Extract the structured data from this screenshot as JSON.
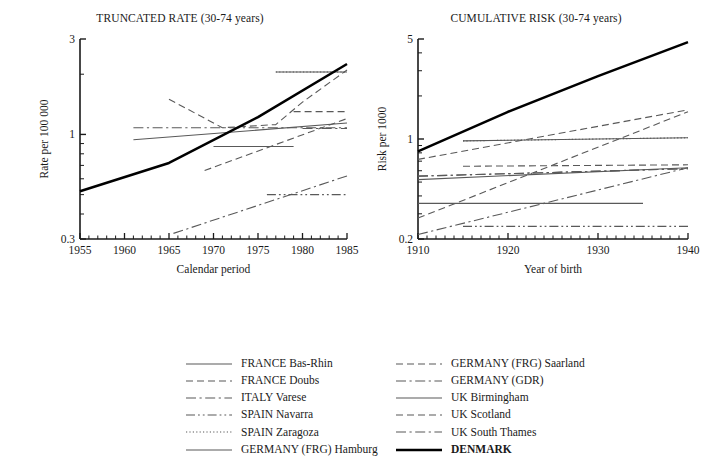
{
  "chart_data": [
    {
      "type": "line",
      "title": "TRUNCATED RATE (30-74 years)",
      "xlabel": "Calendar period",
      "ylabel": "Rate per 100 000",
      "xlim": [
        1955,
        1985
      ],
      "ylim": [
        0.3,
        3
      ],
      "yscale": "log",
      "grid": false,
      "legend_position": "below-figure",
      "xticks": [
        1955,
        1960,
        1965,
        1970,
        1975,
        1980,
        1985
      ],
      "xtick_labels": [
        "1955",
        "1960",
        "1965",
        "1970",
        "1975",
        "1980",
        "1985"
      ],
      "xtick_minor_step": 1,
      "yticks": [
        0.3,
        1,
        3
      ],
      "ytick_labels": [
        "0.3",
        "1",
        "3"
      ],
      "ytick_minor": [
        0.4,
        0.5,
        0.6,
        0.7,
        0.8,
        0.9,
        2
      ],
      "series": [
        {
          "name": "FRANCE Bas-Rhin",
          "style": "solid",
          "x": [
            1961,
            1985
          ],
          "y": [
            0.94,
            1.14
          ]
        },
        {
          "name": "FRANCE Doubs",
          "style": "dashed",
          "x": [
            1965,
            1971,
            1977,
            1980,
            1985
          ],
          "y": [
            1.5,
            1.08,
            1.12,
            1.45,
            2.1
          ]
        },
        {
          "name": "ITALY Varese",
          "style": "dashdot",
          "x": [
            1961,
            1985
          ],
          "y": [
            1.08,
            1.08
          ]
        },
        {
          "name": "SPAIN Navarra",
          "style": "dashdotdot",
          "x": [
            1976,
            1985
          ],
          "y": [
            0.5,
            0.5
          ]
        },
        {
          "name": "SPAIN Zaragoza",
          "style": "dotted",
          "x": [
            1977,
            1985
          ],
          "y": [
            2.05,
            2.05
          ]
        },
        {
          "name": "GERMANY (FRG) Hamburg",
          "style": "solid",
          "x": [
            1977,
            1985
          ],
          "y": [
            2.05,
            2.05
          ]
        },
        {
          "name": "GERMANY (FRG) Saarland",
          "style": "dashed",
          "x": [
            1979,
            1985
          ],
          "y": [
            1.3,
            1.3
          ]
        },
        {
          "name": "GERMANY (GDR)",
          "style": "dashdot",
          "x": [
            1965.5,
            1985
          ],
          "y": [
            0.32,
            0.62
          ]
        },
        {
          "name": "UK Birmingham",
          "style": "solid",
          "x": [
            1970,
            1979
          ],
          "y": [
            0.87,
            0.87
          ]
        },
        {
          "name": "UK Scotland",
          "style": "dashed",
          "x": [
            1969,
            1985
          ],
          "y": [
            0.66,
            1.2
          ]
        },
        {
          "name": "UK South Thames",
          "style": "dashdot",
          "x": [
            1980,
            1985
          ],
          "y": [
            1.07,
            1.07
          ]
        },
        {
          "name": "DENMARK",
          "style": "thick-solid",
          "x": [
            1955,
            1965,
            1975,
            1985
          ],
          "y": [
            0.52,
            0.72,
            1.22,
            2.25
          ]
        }
      ]
    },
    {
      "type": "line",
      "title": "CUMULATIVE RISK (30-74 years)",
      "xlabel": "Year of birth",
      "ylabel": "Risk per 1000",
      "xlim": [
        1910,
        1940
      ],
      "ylim": [
        0.2,
        5
      ],
      "yscale": "log",
      "grid": false,
      "legend_position": "below-figure",
      "xticks": [
        1910,
        1920,
        1930,
        1940
      ],
      "xtick_labels": [
        "1910",
        "1920",
        "1930",
        "1940"
      ],
      "xtick_minor_step": 1,
      "yticks": [
        0.2,
        1,
        5
      ],
      "ytick_labels": [
        "0.2",
        "1",
        "5"
      ],
      "ytick_minor": [
        0.3,
        0.4,
        0.5,
        0.6,
        0.7,
        0.8,
        0.9,
        2,
        3,
        4
      ],
      "series": [
        {
          "name": "FRANCE Bas-Rhin",
          "style": "solid",
          "x": [
            1910,
            1940
          ],
          "y": [
            0.52,
            0.63
          ]
        },
        {
          "name": "FRANCE Doubs",
          "style": "dashed",
          "x": [
            1910,
            1940
          ],
          "y": [
            0.28,
            1.55
          ]
        },
        {
          "name": "ITALY Varese",
          "style": "dashdot",
          "x": [
            1910,
            1940
          ],
          "y": [
            0.55,
            0.62
          ]
        },
        {
          "name": "SPAIN Navarra",
          "style": "dashdotdot",
          "x": [
            1915,
            1940
          ],
          "y": [
            0.245,
            0.245
          ]
        },
        {
          "name": "SPAIN Zaragoza",
          "style": "dotted",
          "x": [
            1915,
            1940
          ],
          "y": [
            0.97,
            1.02
          ]
        },
        {
          "name": "GERMANY (FRG) Hamburg",
          "style": "solid",
          "x": [
            1915,
            1940
          ],
          "y": [
            0.97,
            1.02
          ]
        },
        {
          "name": "GERMANY (FRG) Saarland",
          "style": "dashed",
          "x": [
            1915,
            1940
          ],
          "y": [
            0.645,
            0.66
          ]
        },
        {
          "name": "GERMANY (GDR)",
          "style": "dashdot",
          "x": [
            1910,
            1940
          ],
          "y": [
            0.215,
            0.63
          ]
        },
        {
          "name": "UK Birmingham",
          "style": "solid",
          "x": [
            1910,
            1935
          ],
          "y": [
            0.355,
            0.355
          ]
        },
        {
          "name": "UK Scotland",
          "style": "dashed",
          "x": [
            1910,
            1940
          ],
          "y": [
            0.72,
            1.6
          ]
        },
        {
          "name": "UK South Thames",
          "style": "dashdot",
          "x": [
            1910,
            1940
          ],
          "y": [
            0.55,
            0.62
          ]
        },
        {
          "name": "DENMARK",
          "style": "thick-solid",
          "x": [
            1910,
            1920,
            1930,
            1940
          ],
          "y": [
            0.82,
            1.55,
            2.75,
            4.75
          ]
        }
      ]
    }
  ],
  "legend": {
    "columns": [
      {
        "items": [
          {
            "label": "FRANCE Bas-Rhin",
            "style": "solid",
            "bold": false
          },
          {
            "label": "FRANCE Doubs",
            "style": "dashed",
            "bold": false
          },
          {
            "label": "ITALY Varese",
            "style": "dashdot",
            "bold": false
          },
          {
            "label": "SPAIN Navarra",
            "style": "dashdotdot",
            "bold": false
          },
          {
            "label": "SPAIN Zaragoza",
            "style": "dotted",
            "bold": false
          },
          {
            "label": "GERMANY (FRG) Hamburg",
            "style": "solid",
            "bold": false
          }
        ]
      },
      {
        "items": [
          {
            "label": "GERMANY (FRG) Saarland",
            "style": "dashed",
            "bold": false
          },
          {
            "label": "GERMANY (GDR)",
            "style": "dashdot",
            "bold": false
          },
          {
            "label": "UK Birmingham",
            "style": "solid",
            "bold": false
          },
          {
            "label": "UK Scotland",
            "style": "dashed",
            "bold": false
          },
          {
            "label": "UK South Thames",
            "style": "dashdot",
            "bold": false
          },
          {
            "label": "DENMARK",
            "style": "thick-solid",
            "bold": true
          }
        ]
      }
    ]
  },
  "colors": {
    "axis": "#1a1a1a",
    "series_line": "#595959",
    "emphasis_line": "#000000",
    "background": "#ffffff"
  }
}
